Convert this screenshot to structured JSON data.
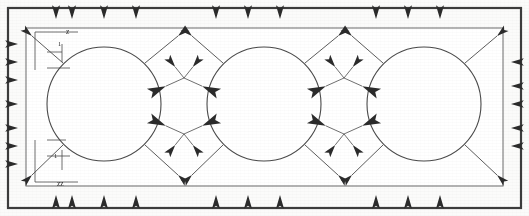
{
  "figure": {
    "kind": "vector-field-diagram",
    "background_color": "#fbfbfa",
    "ink_color": "#2b2b2b",
    "line_color": "#4a4a4a"
  },
  "outer_frame": {
    "name": "outer-frame",
    "x": 8,
    "y": 8,
    "width": 513,
    "height": 200,
    "stroke": "#3c3c3c",
    "stroke_width": 2.2,
    "fill": "none"
  },
  "inner_frame": {
    "name": "domain-boundary",
    "x": 26,
    "y": 28,
    "width": 477,
    "height": 158,
    "stroke": "#6b6b6b",
    "stroke_width": 1.0,
    "fill": "#ffffff"
  },
  "circles": [
    {
      "label": "cylinder-1",
      "cx": 104,
      "cy": 104,
      "r": 57
    },
    {
      "label": "cylinder-2",
      "cx": 264,
      "cy": 104,
      "r": 57
    },
    {
      "label": "cylinder-3",
      "cx": 424,
      "cy": 104,
      "r": 57
    }
  ],
  "axis_labels": {
    "y_axis_label": "z",
    "x_axis_label": "zz",
    "tick_label_top": "1",
    "tick_label_bottom": "1"
  },
  "chart_data": {
    "type": "scatter",
    "xlabel": "zz",
    "ylabel": "z",
    "xlim": [
      26,
      503
    ],
    "ylim": [
      28,
      186
    ],
    "grid": false,
    "legend": "none",
    "annotations": [
      "z",
      "zz",
      "1",
      "1"
    ],
    "vectors": [
      {
        "x": 56,
        "y": 34,
        "dx": 0,
        "dy": -1,
        "len": 15,
        "group": "top-edge"
      },
      {
        "x": 72,
        "y": 34,
        "dx": 0,
        "dy": -1,
        "len": 15,
        "group": "top-edge"
      },
      {
        "x": 104,
        "y": 34,
        "dx": 0,
        "dy": -1,
        "len": 15,
        "group": "top-edge"
      },
      {
        "x": 136,
        "y": 34,
        "dx": 0,
        "dy": -1,
        "len": 15,
        "group": "top-edge"
      },
      {
        "x": 216,
        "y": 34,
        "dx": 0,
        "dy": -1,
        "len": 15,
        "group": "top-edge"
      },
      {
        "x": 248,
        "y": 34,
        "dx": 0,
        "dy": -1,
        "len": 15,
        "group": "top-edge"
      },
      {
        "x": 280,
        "y": 34,
        "dx": 0,
        "dy": -1,
        "len": 15,
        "group": "top-edge"
      },
      {
        "x": 376,
        "y": 34,
        "dx": 0,
        "dy": -1,
        "len": 15,
        "group": "top-edge"
      },
      {
        "x": 408,
        "y": 34,
        "dx": 0,
        "dy": -1,
        "len": 15,
        "group": "top-edge"
      },
      {
        "x": 440,
        "y": 34,
        "dx": 0,
        "dy": -1,
        "len": 15,
        "group": "top-edge"
      },
      {
        "x": 56,
        "y": 180,
        "dx": 0,
        "dy": 1,
        "len": 15,
        "group": "bottom-edge"
      },
      {
        "x": 72,
        "y": 180,
        "dx": 0,
        "dy": 1,
        "len": 15,
        "group": "bottom-edge"
      },
      {
        "x": 104,
        "y": 180,
        "dx": 0,
        "dy": 1,
        "len": 15,
        "group": "bottom-edge"
      },
      {
        "x": 136,
        "y": 180,
        "dx": 0,
        "dy": 1,
        "len": 15,
        "group": "bottom-edge"
      },
      {
        "x": 216,
        "y": 180,
        "dx": 0,
        "dy": 1,
        "len": 15,
        "group": "bottom-edge"
      },
      {
        "x": 248,
        "y": 180,
        "dx": 0,
        "dy": 1,
        "len": 15,
        "group": "bottom-edge"
      },
      {
        "x": 280,
        "y": 180,
        "dx": 0,
        "dy": 1,
        "len": 15,
        "group": "bottom-edge"
      },
      {
        "x": 376,
        "y": 180,
        "dx": 0,
        "dy": 1,
        "len": 15,
        "group": "bottom-edge"
      },
      {
        "x": 408,
        "y": 180,
        "dx": 0,
        "dy": 1,
        "len": 15,
        "group": "bottom-edge"
      },
      {
        "x": 440,
        "y": 180,
        "dx": 0,
        "dy": 1,
        "len": 15,
        "group": "bottom-edge"
      },
      {
        "x": 32,
        "y": 44,
        "dx": -1,
        "dy": 0,
        "len": 14,
        "group": "left-edge"
      },
      {
        "x": 32,
        "y": 62,
        "dx": -1,
        "dy": 0,
        "len": 14,
        "group": "left-edge"
      },
      {
        "x": 32,
        "y": 80,
        "dx": -1,
        "dy": 0,
        "len": 14,
        "group": "left-edge"
      },
      {
        "x": 32,
        "y": 104,
        "dx": -1,
        "dy": 0,
        "len": 14,
        "group": "left-edge"
      },
      {
        "x": 32,
        "y": 128,
        "dx": -1,
        "dy": 0,
        "len": 14,
        "group": "left-edge"
      },
      {
        "x": 32,
        "y": 146,
        "dx": -1,
        "dy": 0,
        "len": 14,
        "group": "left-edge"
      },
      {
        "x": 32,
        "y": 164,
        "dx": -1,
        "dy": 0,
        "len": 14,
        "group": "left-edge"
      },
      {
        "x": 497,
        "y": 62,
        "dx": 1,
        "dy": 0,
        "len": 14,
        "group": "right-edge"
      },
      {
        "x": 497,
        "y": 86,
        "dx": 1,
        "dy": 0,
        "len": 14,
        "group": "right-edge"
      },
      {
        "x": 497,
        "y": 104,
        "dx": 1,
        "dy": 0,
        "len": 14,
        "group": "right-edge"
      },
      {
        "x": 497,
        "y": 128,
        "dx": 1,
        "dy": 0,
        "len": 14,
        "group": "right-edge"
      },
      {
        "x": 497,
        "y": 146,
        "dx": 1,
        "dy": 0,
        "len": 14,
        "group": "right-edge"
      },
      {
        "x": 184,
        "y": 78,
        "dx": -1,
        "dy": 0.45,
        "len": 20,
        "group": "saddle-upper-1"
      },
      {
        "x": 184,
        "y": 78,
        "dx": 1,
        "dy": 0.45,
        "len": 20,
        "group": "saddle-upper-1"
      },
      {
        "x": 184,
        "y": 78,
        "dx": -0.8,
        "dy": -1,
        "len": 14,
        "group": "saddle-upper-1"
      },
      {
        "x": 184,
        "y": 78,
        "dx": 0.8,
        "dy": -1,
        "len": 14,
        "group": "saddle-upper-1"
      },
      {
        "x": 184,
        "y": 134,
        "dx": -1,
        "dy": -0.45,
        "len": 20,
        "group": "saddle-lower-1"
      },
      {
        "x": 184,
        "y": 134,
        "dx": 1,
        "dy": -0.45,
        "len": 20,
        "group": "saddle-lower-1"
      },
      {
        "x": 184,
        "y": 134,
        "dx": -0.8,
        "dy": 1,
        "len": 14,
        "group": "saddle-lower-1"
      },
      {
        "x": 184,
        "y": 134,
        "dx": 0.8,
        "dy": 1,
        "len": 14,
        "group": "saddle-lower-1"
      },
      {
        "x": 344,
        "y": 78,
        "dx": -1,
        "dy": 0.45,
        "len": 20,
        "group": "saddle-upper-2"
      },
      {
        "x": 344,
        "y": 78,
        "dx": 1,
        "dy": 0.45,
        "len": 20,
        "group": "saddle-upper-2"
      },
      {
        "x": 344,
        "y": 78,
        "dx": -0.8,
        "dy": -1,
        "len": 14,
        "group": "saddle-upper-2"
      },
      {
        "x": 344,
        "y": 78,
        "dx": 0.8,
        "dy": -1,
        "len": 14,
        "group": "saddle-upper-2"
      },
      {
        "x": 344,
        "y": 134,
        "dx": -1,
        "dy": -0.45,
        "len": 20,
        "group": "saddle-lower-2"
      },
      {
        "x": 344,
        "y": 134,
        "dx": 1,
        "dy": -0.45,
        "len": 20,
        "group": "saddle-lower-2"
      },
      {
        "x": 344,
        "y": 134,
        "dx": -0.8,
        "dy": 1,
        "len": 14,
        "group": "saddle-lower-2"
      },
      {
        "x": 344,
        "y": 134,
        "dx": 0.8,
        "dy": 1,
        "len": 14,
        "group": "saddle-lower-2"
      }
    ],
    "diagonal_rays": [
      {
        "x1": 145,
        "y1": 63,
        "x2": 178,
        "y2": 36,
        "group": "ray-c1-ne"
      },
      {
        "x1": 145,
        "y1": 145,
        "x2": 178,
        "y2": 175,
        "group": "ray-c1-se"
      },
      {
        "x1": 223,
        "y1": 63,
        "x2": 192,
        "y2": 36,
        "group": "ray-c2-nw"
      },
      {
        "x1": 223,
        "y1": 145,
        "x2": 192,
        "y2": 175,
        "group": "ray-c2-sw"
      },
      {
        "x1": 305,
        "y1": 63,
        "x2": 338,
        "y2": 36,
        "group": "ray-c2-ne"
      },
      {
        "x1": 305,
        "y1": 145,
        "x2": 338,
        "y2": 175,
        "group": "ray-c2-se"
      },
      {
        "x1": 383,
        "y1": 63,
        "x2": 352,
        "y2": 36,
        "group": "ray-c3-nw"
      },
      {
        "x1": 383,
        "y1": 145,
        "x2": 352,
        "y2": 175,
        "group": "ray-c3-sw"
      },
      {
        "x1": 465,
        "y1": 63,
        "x2": 497,
        "y2": 36,
        "group": "ray-c3-ne"
      },
      {
        "x1": 465,
        "y1": 145,
        "x2": 497,
        "y2": 175,
        "group": "ray-c3-se"
      },
      {
        "x1": 63,
        "y1": 63,
        "x2": 32,
        "y2": 36,
        "group": "ray-c1-nw"
      },
      {
        "x1": 63,
        "y1": 145,
        "x2": 32,
        "y2": 175,
        "group": "ray-c1-sw"
      }
    ]
  }
}
